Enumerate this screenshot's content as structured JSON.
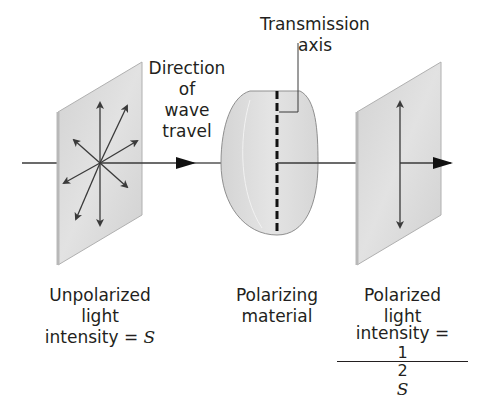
{
  "diagram": {
    "labels": {
      "transmission_axis": "Transmission axis",
      "direction": [
        "Direction",
        "of",
        "wave",
        "travel"
      ],
      "unpolarized": {
        "line1": "Unpolarized",
        "line2": "light",
        "line3_prefix": "intensity = ",
        "symbol": "S"
      },
      "polarizing": {
        "line1": "Polarizing",
        "line2": "material"
      },
      "polarized": {
        "line1": "Polarized",
        "line2": "light",
        "line3_prefix": "intensity = ",
        "fraction_numerator": "1",
        "fraction_denominator": "2",
        "symbol": "S"
      }
    },
    "colors": {
      "panel_fill": "#d9d9d9",
      "panel_edge": "#a8a8a8",
      "lens_fill": "#dcdcdc",
      "line": "#3a3a3a",
      "text": "#231f20"
    },
    "components": [
      {
        "name": "unpolarized-light-panel",
        "arrows": 8
      },
      {
        "name": "polarizing-material-lens",
        "axis": "vertical"
      },
      {
        "name": "polarized-light-panel",
        "arrows": 1
      }
    ]
  }
}
